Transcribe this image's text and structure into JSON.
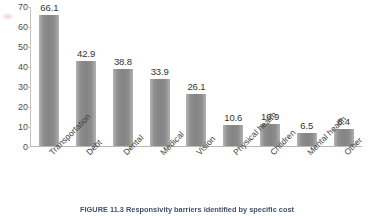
{
  "chart_data": {
    "type": "bar",
    "title": "",
    "xlabel": "",
    "ylabel": "",
    "ylim": [
      0,
      70
    ],
    "yticks": [
      0,
      10,
      20,
      30,
      40,
      50,
      60,
      70
    ],
    "grid": false,
    "legend": false,
    "bar_color": "#8a8a8a",
    "categories": [
      "Transportation",
      "Debt",
      "Dental",
      "Medical",
      "Vision",
      "Physical health",
      "Children",
      "Mental health",
      "Other"
    ],
    "values": [
      66.1,
      42.9,
      38.8,
      33.9,
      26.1,
      10.6,
      10.9,
      6.5,
      8.4
    ],
    "data_labels": [
      "66.1",
      "42.9",
      "38.8",
      "33.9",
      "26.1",
      "10.6",
      "10.9",
      "6.5",
      "8.4"
    ]
  },
  "caption": {
    "text": "FIGURE 11.3  Responsivity barriers identified by specific cost"
  }
}
